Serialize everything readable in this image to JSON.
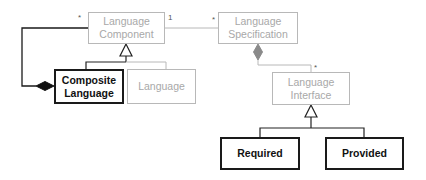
{
  "diagram": {
    "type": "uml-class-diagram",
    "classes": [
      {
        "id": "language_component",
        "label": "Language\nComponent",
        "line1": "Language",
        "line2": "Component",
        "style": "faded"
      },
      {
        "id": "language_specification",
        "label": "Language\nSpecification",
        "line1": "Language",
        "line2": "Specification",
        "style": "faded"
      },
      {
        "id": "composite_language",
        "label": "Composite\nLanguage",
        "line1": "Composite",
        "line2": "Language",
        "style": "strong"
      },
      {
        "id": "language",
        "label": "Language",
        "line1": "Language",
        "style": "faded"
      },
      {
        "id": "language_interface",
        "label": "Language\nInterface",
        "line1": "Language",
        "line2": "Interface",
        "style": "faded"
      },
      {
        "id": "required",
        "label": "Required",
        "line1": "Required",
        "style": "strong"
      },
      {
        "id": "provided",
        "label": "Provided",
        "line1": "Provided",
        "style": "strong"
      }
    ],
    "relations": [
      {
        "type": "composition",
        "from": "composite_language",
        "to": "language_component",
        "multiplicity_target": "*"
      },
      {
        "type": "association",
        "from": "language_component",
        "to": "language_specification",
        "multiplicity_source": "1",
        "multiplicity_target": "*"
      },
      {
        "type": "generalization",
        "from": "composite_language",
        "to": "language_component"
      },
      {
        "type": "generalization",
        "from": "language",
        "to": "language_component"
      },
      {
        "type": "composition",
        "from": "language_specification",
        "to": "language_interface",
        "multiplicity_target": "*"
      },
      {
        "type": "generalization",
        "from": "required",
        "to": "language_interface"
      },
      {
        "type": "generalization",
        "from": "provided",
        "to": "language_interface"
      }
    ],
    "multiplicities": {
      "component_star": "*",
      "component_one": "1",
      "spec_star": "*",
      "interface_star": "*"
    },
    "colors": {
      "strong": "#1a1a1a",
      "faded_border": "#b8b8b8",
      "faded_text": "#a8a8a8",
      "faded_diamond": "#8a8a8a"
    }
  }
}
